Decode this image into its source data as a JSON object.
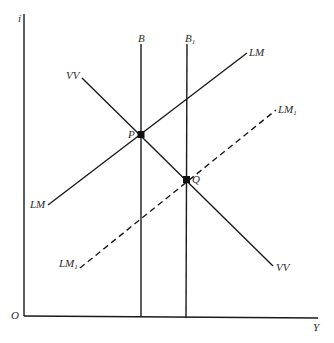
{
  "diagram": {
    "type": "economics-curve-diagram",
    "axes": {
      "y_label": "i",
      "x_label": "Y",
      "origin_label": "O"
    },
    "curves": [
      {
        "id": "B",
        "label": "B",
        "style": "solid",
        "orientation": "vertical"
      },
      {
        "id": "B1",
        "label": "B",
        "label_sub": "1",
        "style": "solid",
        "orientation": "vertical"
      },
      {
        "id": "LM",
        "label_left": "LM",
        "label_right": "LM",
        "style": "solid",
        "slope": "upward"
      },
      {
        "id": "LM1",
        "label_left": "LM",
        "label_left_sub": "1",
        "label_right": "LM",
        "label_right_sub": "1",
        "style": "dashed",
        "slope": "upward"
      },
      {
        "id": "VV",
        "label_left": "VV",
        "label_right": "VV",
        "style": "solid",
        "slope": "downward"
      }
    ],
    "points": [
      {
        "id": "P",
        "label": "P",
        "intersection": [
          "B",
          "LM",
          "VV"
        ]
      },
      {
        "id": "Q",
        "label": "Q",
        "intersection": [
          "B1",
          "LM1",
          "VV"
        ]
      }
    ],
    "colors": {
      "line": "#1a1a1a",
      "text": "#2a2a2a",
      "background": "#ffffff"
    }
  }
}
